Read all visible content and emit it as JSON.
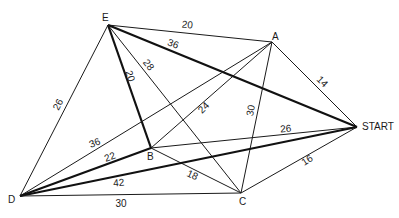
{
  "graph": {
    "vertices": [
      {
        "id": "E",
        "label": "E",
        "x": 108,
        "y": 25,
        "lx": 102,
        "ly": 21
      },
      {
        "id": "A",
        "label": "A",
        "x": 272,
        "y": 42,
        "lx": 272,
        "ly": 40
      },
      {
        "id": "START",
        "label": "START",
        "x": 357,
        "y": 127,
        "lx": 362,
        "ly": 130
      },
      {
        "id": "B",
        "label": "B",
        "x": 151,
        "y": 148,
        "lx": 147,
        "ly": 160
      },
      {
        "id": "D",
        "label": "D",
        "x": 20,
        "y": 196,
        "lx": 8,
        "ly": 203
      },
      {
        "id": "C",
        "label": "C",
        "x": 241,
        "y": 193,
        "lx": 239,
        "ly": 205
      }
    ],
    "edges": [
      {
        "from": "E",
        "to": "A",
        "weight": "20",
        "bold": false,
        "lx": 187,
        "ly": 28,
        "rot": 6
      },
      {
        "from": "E",
        "to": "START",
        "weight": "36",
        "bold": true,
        "lx": 172,
        "ly": 47,
        "rot": 20
      },
      {
        "from": "E",
        "to": "B",
        "weight": "20",
        "bold": true,
        "lx": 127,
        "ly": 77,
        "rot": 72
      },
      {
        "from": "E",
        "to": "C",
        "weight": "28",
        "bold": false,
        "lx": 146,
        "ly": 67,
        "rot": 52
      },
      {
        "from": "E",
        "to": "D",
        "weight": "26",
        "bold": false,
        "lx": 61,
        "ly": 106,
        "rot": -63
      },
      {
        "from": "A",
        "to": "START",
        "weight": "14",
        "bold": false,
        "lx": 320,
        "ly": 84,
        "rot": 45
      },
      {
        "from": "A",
        "to": "C",
        "weight": "30",
        "bold": false,
        "lx": 254,
        "ly": 111,
        "rot": -80
      },
      {
        "from": "A",
        "to": "B",
        "weight": "24",
        "bold": false,
        "lx": 206,
        "ly": 110,
        "rot": -45
      },
      {
        "from": "A",
        "to": "D",
        "weight": "36",
        "bold": false,
        "lx": 96,
        "ly": 146,
        "rot": -22
      },
      {
        "from": "B",
        "to": "START",
        "weight": "26",
        "bold": false,
        "lx": 286,
        "ly": 132,
        "rot": -5
      },
      {
        "from": "B",
        "to": "C",
        "weight": "18",
        "bold": false,
        "lx": 191,
        "ly": 178,
        "rot": 25
      },
      {
        "from": "B",
        "to": "D",
        "weight": "22",
        "bold": true,
        "lx": 111,
        "ly": 160,
        "rot": -20
      },
      {
        "from": "D",
        "to": "START",
        "weight": "42",
        "bold": true,
        "lx": 119,
        "ly": 186,
        "rot": -5
      },
      {
        "from": "D",
        "to": "C",
        "weight": "30",
        "bold": false,
        "lx": 121,
        "ly": 207,
        "rot": 0
      },
      {
        "from": "C",
        "to": "START",
        "weight": "16",
        "bold": false,
        "lx": 309,
        "ly": 163,
        "rot": -33
      }
    ]
  },
  "colors": {
    "line": "#1a1a1a",
    "background": "#ffffff"
  }
}
